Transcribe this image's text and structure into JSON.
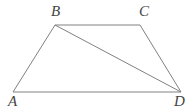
{
  "figure": {
    "kind": "geometry-diagram",
    "width": 195,
    "height": 112,
    "background_color": "#ffffff",
    "stroke_color": "#808080",
    "stroke_width": 1,
    "label_color": "#444444",
    "labels": {
      "A": "A",
      "B": "B",
      "C": "C",
      "D": "D"
    },
    "vertices": [
      {
        "name": "A",
        "x": 13,
        "y": 92,
        "label": "A",
        "label_x": 8,
        "label_y": 94
      },
      {
        "name": "B",
        "x": 55,
        "y": 25,
        "label": "B",
        "label_x": 51,
        "label_y": 4
      },
      {
        "name": "C",
        "x": 140,
        "y": 25,
        "label": "C",
        "label_x": 139,
        "label_y": 4
      },
      {
        "name": "D",
        "x": 181,
        "y": 92,
        "label": "D",
        "label_x": 174,
        "label_y": 94
      }
    ],
    "segments": [
      {
        "name": "AB",
        "from": "A",
        "to": "B",
        "x1": 13,
        "y1": 92,
        "x2": 55,
        "y2": 25
      },
      {
        "name": "BC",
        "from": "B",
        "to": "C",
        "x1": 55,
        "y1": 25,
        "x2": 140,
        "y2": 25
      },
      {
        "name": "CD",
        "from": "C",
        "to": "D",
        "x1": 140,
        "y1": 25,
        "x2": 181,
        "y2": 92
      },
      {
        "name": "DA",
        "from": "D",
        "to": "A",
        "x1": 181,
        "y1": 92,
        "x2": 13,
        "y2": 92
      },
      {
        "name": "BD",
        "from": "B",
        "to": "D",
        "x1": 55,
        "y1": 25,
        "x2": 181,
        "y2": 92
      }
    ]
  }
}
